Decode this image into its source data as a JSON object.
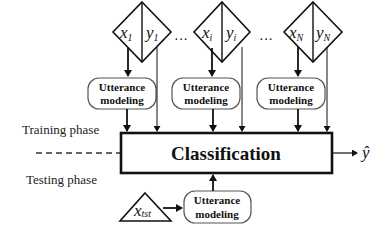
{
  "diagram": {
    "inputs": [
      {
        "x_label": "x",
        "x_sub": "1",
        "y_label": "y",
        "y_sub": "1"
      },
      {
        "x_label": "x",
        "x_sub": "i",
        "y_label": "y",
        "y_sub": "i"
      },
      {
        "x_label": "x",
        "x_sub": "N",
        "y_label": "y",
        "y_sub": "N"
      }
    ],
    "ellipsis": [
      "···",
      "···"
    ],
    "utterance_boxes": [
      {
        "line1": "Utterance",
        "line2": "modeling"
      },
      {
        "line1": "Utterance",
        "line2": "modeling"
      },
      {
        "line1": "Utterance",
        "line2": "modeling"
      }
    ],
    "test_utterance_box": {
      "line1": "Utterance",
      "line2": "modeling"
    },
    "classification_label": "Classification",
    "output_label": "ŷ",
    "training_phase_label": "Training phase",
    "testing_phase_label": "Testing phase",
    "test_input": {
      "label": "x",
      "sub": "tst"
    }
  }
}
